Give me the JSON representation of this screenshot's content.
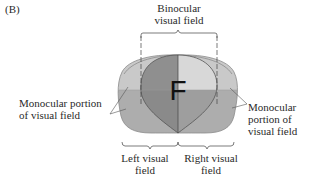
{
  "figure": {
    "panel_label": "(B)",
    "center_letter": "F",
    "labels": {
      "binocular": [
        "Binocular",
        "visual field"
      ],
      "monocular_left": [
        "Monocular portion",
        "of visual field"
      ],
      "monocular_right": [
        "Monocular",
        "portion of",
        "visual field"
      ],
      "left_field": [
        "Left visual",
        "field"
      ],
      "right_field": [
        "Right visual",
        "field"
      ]
    },
    "colors": {
      "outer_upper": "#c9c9c9",
      "outer_lower": "#acacac",
      "binocular_upper_left": "#8f8f8f",
      "binocular_upper_right": "#d6d6d6",
      "binocular_lower_left": "#8a8a8a",
      "binocular_lower_right": "#9c9c9c",
      "outline": "#555555",
      "text": "#2a2a2a"
    }
  }
}
